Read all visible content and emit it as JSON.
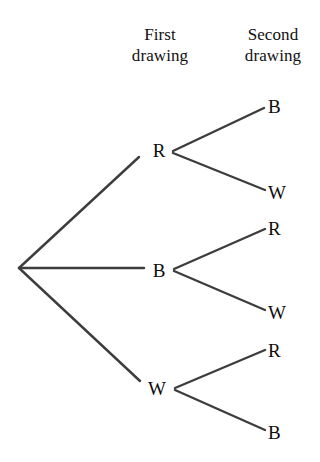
{
  "figure": {
    "type": "probability-tree-diagram",
    "title": "",
    "line_color": "#3d3d3d",
    "text_color": "#0d0d0d",
    "background_color": "#ffffff"
  },
  "headers": {
    "first": {
      "line1": "First",
      "line2": "drawing"
    },
    "second": {
      "line1": "Second",
      "line2": "drawing"
    }
  },
  "tree": {
    "root": {
      "x": 19,
      "y": 268
    },
    "level1": [
      {
        "label": "R",
        "x": 160,
        "y": 150
      },
      {
        "label": "B",
        "x": 160,
        "y": 270
      },
      {
        "label": "W",
        "x": 160,
        "y": 388
      }
    ],
    "level2": [
      {
        "label": "B",
        "x": 275,
        "y": 105,
        "parent": "R"
      },
      {
        "label": "W",
        "x": 275,
        "y": 192,
        "parent": "R"
      },
      {
        "label": "R",
        "x": 275,
        "y": 228,
        "parent": "B"
      },
      {
        "label": "W",
        "x": 275,
        "y": 312,
        "parent": "B"
      },
      {
        "label": "R",
        "x": 275,
        "y": 350,
        "parent": "W"
      },
      {
        "label": "B",
        "x": 275,
        "y": 432,
        "parent": "W"
      }
    ]
  }
}
